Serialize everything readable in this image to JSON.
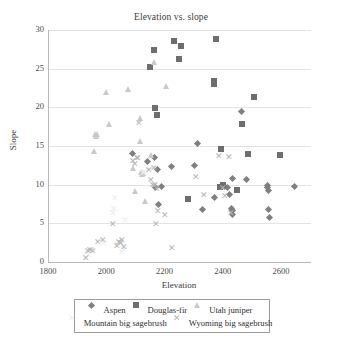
{
  "chart_data": {
    "type": "scatter",
    "title": "Elevation vs. slope",
    "xlabel": "Elevation",
    "ylabel": "Slope",
    "xlim": [
      1800,
      2700
    ],
    "ylim": [
      0,
      30
    ],
    "xticks": [
      1800,
      2000,
      2200,
      2400,
      2600
    ],
    "yticks": [
      0,
      5,
      10,
      15,
      20,
      25,
      30
    ],
    "grid": "horizontal",
    "legend_position": "bottom",
    "series": [
      {
        "name": "Aspen",
        "marker": "diamond",
        "color": "#7f7f7f",
        "points": [
          [
            2087,
            14.0
          ],
          [
            2139,
            13.0
          ],
          [
            2163,
            13.5
          ],
          [
            2174,
            11.9
          ],
          [
            2221,
            12.3
          ],
          [
            2310,
            15.3
          ],
          [
            2299,
            12.5
          ],
          [
            2176,
            7.4
          ],
          [
            2327,
            6.8
          ],
          [
            2370,
            8.4
          ],
          [
            2392,
            9.7
          ],
          [
            2404,
            9.8
          ],
          [
            2412,
            9.6
          ],
          [
            2420,
            8.7
          ],
          [
            2430,
            10.8
          ],
          [
            2427,
            6.9
          ],
          [
            2430,
            6.2
          ],
          [
            2432,
            6.6
          ],
          [
            2462,
            19.5
          ],
          [
            2477,
            10.7
          ],
          [
            2549,
            9.9
          ],
          [
            2552,
            9.6
          ],
          [
            2553,
            9.2
          ],
          [
            2554,
            6.8
          ],
          [
            2556,
            5.7
          ],
          [
            2643,
            9.8
          ],
          [
            2166,
            9.6
          ],
          [
            2186,
            9.7
          ]
        ]
      },
      {
        "name": "Douglas-fir",
        "marker": "square",
        "color": "#6e6e6e",
        "points": [
          [
            2146,
            25.2
          ],
          [
            2160,
            27.4
          ],
          [
            2163,
            19.9
          ],
          [
            2172,
            19.0
          ],
          [
            2230,
            28.6
          ],
          [
            2246,
            26.2
          ],
          [
            2252,
            27.9
          ],
          [
            2277,
            8.1
          ],
          [
            2366,
            23.4
          ],
          [
            2366,
            23.0
          ],
          [
            2372,
            28.8
          ],
          [
            2390,
            14.6
          ],
          [
            2388,
            9.7
          ],
          [
            2398,
            9.9
          ],
          [
            2447,
            9.3
          ],
          [
            2462,
            17.9
          ],
          [
            2483,
            14.0
          ],
          [
            2505,
            21.4
          ],
          [
            2595,
            13.8
          ]
        ]
      },
      {
        "name": "Utah juniper",
        "marker": "triangle",
        "color": "#c9c9c9",
        "points": [
          [
            1957,
            14.4
          ],
          [
            1959,
            16.6
          ],
          [
            1962,
            16.3
          ],
          [
            1968,
            16.6
          ],
          [
            1996,
            22.0
          ],
          [
            2008,
            17.8
          ],
          [
            2073,
            22.4
          ],
          [
            2113,
            18.6
          ],
          [
            2114,
            15.6
          ],
          [
            2118,
            11.6
          ],
          [
            2121,
            11.4
          ],
          [
            2124,
            11.5
          ],
          [
            2130,
            7.9
          ],
          [
            2151,
            13.9
          ],
          [
            2161,
            25.9
          ],
          [
            2096,
            9.2
          ],
          [
            2205,
            22.8
          ],
          [
            2090,
            12.1
          ]
        ]
      },
      {
        "name": "Mountain big sagebrush",
        "marker": "dash",
        "color": "#ededed",
        "points": [
          [
            1931,
            1.1
          ],
          [
            1938,
            0.9
          ],
          [
            1944,
            1.6
          ],
          [
            1949,
            1.5
          ],
          [
            2019,
            6.4
          ],
          [
            2022,
            6.8
          ],
          [
            2028,
            8.3
          ],
          [
            2036,
            2.2
          ],
          [
            2051,
            1.3
          ],
          [
            2056,
            1.5
          ],
          [
            2124,
            11.5
          ],
          [
            2129,
            11.7
          ],
          [
            2061,
            5.4
          ],
          [
            1989,
            2.5
          ]
        ]
      },
      {
        "name": "Wyoming big sagebrush",
        "marker": "x",
        "color": "#b5b5b5",
        "points": [
          [
            1928,
            0.5
          ],
          [
            1934,
            1.4
          ],
          [
            1941,
            1.5
          ],
          [
            1952,
            1.4
          ],
          [
            1970,
            2.6
          ],
          [
            1986,
            2.9
          ],
          [
            2019,
            4.9
          ],
          [
            2032,
            2.1
          ],
          [
            2042,
            2.6
          ],
          [
            2046,
            2.4
          ],
          [
            2052,
            2.9
          ],
          [
            2056,
            1.9
          ],
          [
            2089,
            13.0
          ],
          [
            2096,
            12.7
          ],
          [
            2101,
            13.5
          ],
          [
            2105,
            13.4
          ],
          [
            2110,
            18.0
          ],
          [
            2151,
            10.6
          ],
          [
            2157,
            9.9
          ],
          [
            2163,
            9.9
          ],
          [
            2170,
            9.4
          ],
          [
            2159,
            12.2
          ],
          [
            2168,
            4.9
          ],
          [
            2175,
            6.6
          ],
          [
            2197,
            6.1
          ],
          [
            2221,
            1.8
          ],
          [
            2306,
            11.0
          ],
          [
            2333,
            8.6
          ],
          [
            2383,
            13.7
          ],
          [
            2396,
            9.6
          ],
          [
            2419,
            13.6
          ],
          [
            2406,
            8.5
          ],
          [
            2424,
            6.3
          ],
          [
            2145,
            11.9
          ]
        ]
      }
    ]
  },
  "axis": {
    "y_tick_labels": [
      "0",
      "5",
      "10",
      "15",
      "20",
      "25",
      "30"
    ],
    "x_tick_labels": [
      "1800",
      "2000",
      "2200",
      "2400",
      "2600"
    ]
  },
  "legend": {
    "row1": [
      {
        "label": "Aspen",
        "marker": "diamond",
        "color": "#7f7f7f"
      },
      {
        "label": "Douglas-fir",
        "marker": "square",
        "color": "#6e6e6e"
      },
      {
        "label": "Utah juniper",
        "marker": "triangle",
        "color": "#c9c9c9"
      }
    ],
    "row2": [
      {
        "label": "Mountain big sagebrush",
        "marker": "dash",
        "color": "#ededed"
      },
      {
        "label": "Wyoming big sagebrush",
        "marker": "x",
        "color": "#b5b5b5"
      }
    ]
  }
}
